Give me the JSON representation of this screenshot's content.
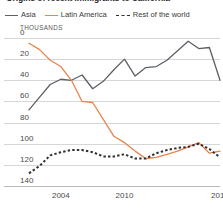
{
  "title": "Origins of recent immigrants to California",
  "legend": {
    "items": [
      {
        "label": "Asia",
        "style": "solid",
        "color": "#5b6066",
        "name": "asia"
      },
      {
        "label": "Latin America",
        "style": "solid",
        "color": "#e8834e",
        "name": "latin-america"
      },
      {
        "label": "Rest of the world",
        "style": "dashed",
        "color": "#2f2f2f",
        "name": "rest-of-world"
      }
    ]
  },
  "axis": {
    "y_unit": "THOUSANDS",
    "y_ticks": [
      "140",
      "120",
      "100",
      "80",
      "60",
      "40",
      "20",
      "0"
    ],
    "x_ticks": [
      "2004",
      "2010",
      "2019"
    ]
  },
  "chart_data": {
    "type": "line",
    "title": "Origins of recent immigrants to California",
    "xlabel": "",
    "ylabel": "THOUSANDS",
    "ylim": [
      0,
      140
    ],
    "xlim": [
      2001,
      2019
    ],
    "grid": true,
    "legend_position": "top",
    "y_ticks": [
      0,
      20,
      40,
      60,
      80,
      100,
      120,
      140
    ],
    "x_ticks": [
      2004,
      2010,
      2019
    ],
    "x": [
      2001,
      2002,
      2003,
      2004,
      2005,
      2006,
      2007,
      2008,
      2009,
      2010,
      2011,
      2012,
      2013,
      2014,
      2015,
      2016,
      2017,
      2018,
      2019
    ],
    "series": [
      {
        "name": "Asia",
        "color": "#5b6066",
        "style": "solid",
        "values": [
          72,
          84,
          96,
          101,
          100,
          105,
          92,
          99,
          110,
          120,
          104,
          112,
          113,
          119,
          128,
          137,
          130,
          131,
          100
        ]
      },
      {
        "name": "Latin America",
        "color": "#e8834e",
        "style": "solid",
        "values": [
          135,
          129,
          119,
          113,
          100,
          80,
          79,
          63,
          47,
          41,
          33,
          26,
          27,
          30,
          33,
          37,
          41,
          31,
          33
        ]
      },
      {
        "name": "Rest of the world",
        "color": "#2f2f2f",
        "style": "dashed",
        "values": [
          12,
          19,
          29,
          32,
          34,
          34,
          32,
          28,
          28,
          30,
          26,
          26,
          31,
          34,
          36,
          37,
          40,
          35,
          27
        ]
      }
    ]
  }
}
